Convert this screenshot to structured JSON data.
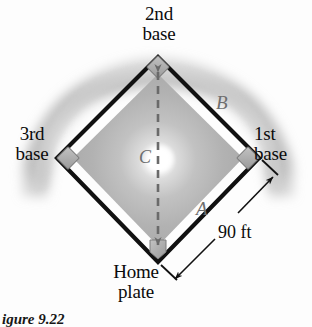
{
  "figure": {
    "caption": "igure 9.22"
  },
  "bases": {
    "second": "2nd\nbase",
    "third": "3rd\nbase",
    "first": "1st\nbase",
    "home": "Home\nplate"
  },
  "sides": {
    "a": "A",
    "b": "B",
    "c": "C"
  },
  "dimension": {
    "value": "90 ft"
  },
  "colors": {
    "outline": "#111111",
    "infield_gray": "#b4b4b4",
    "outfield_gray": "#c9c9c9",
    "base_marker": "#a8a8a8",
    "label_gray": "#6e6e6e",
    "background": "#fdfdfd"
  },
  "geometry": {
    "center_x": 158,
    "center_y": 159,
    "second_base": [
      158,
      57
    ],
    "first_base": [
      259,
      158
    ],
    "third_base": [
      57,
      158
    ],
    "home_plate": [
      158,
      262
    ],
    "side_length_label": "90 ft"
  }
}
